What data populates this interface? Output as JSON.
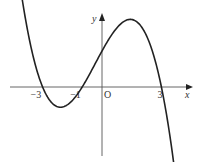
{
  "chart_data": {
    "type": "line",
    "title": "",
    "xlabel": "x",
    "ylabel": "y",
    "origin_label": "O",
    "x_tick_labels": [
      {
        "value": -3,
        "label": "−3"
      },
      {
        "value": -1,
        "label": "−1"
      },
      {
        "value": 3,
        "label": "3"
      }
    ],
    "xlim": [
      -4.6,
      4.5
    ],
    "grid": false,
    "legend": "none",
    "series": [
      {
        "name": "cubic curve",
        "description": "cubic with roots at x = -3, x = -1 (approx.), x = 3; local minimum near x = -2, local maximum near x = 1; decreasing toward -infinity as x increases past 3",
        "roots": [
          -3,
          -1,
          3
        ],
        "leading_sign": -1,
        "x_range": [
          -4.3,
          4.1
        ]
      }
    ]
  }
}
